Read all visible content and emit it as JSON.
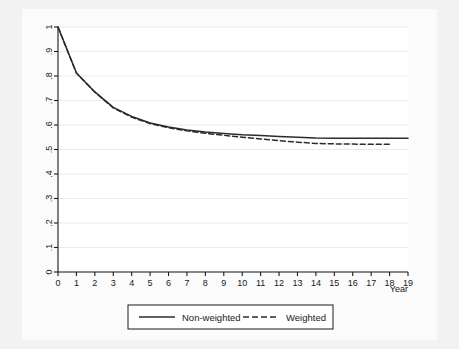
{
  "figure": {
    "background_color": "#f2f2f2",
    "plot_background_color": "#ffffff",
    "line_color": "#2b2b2b"
  },
  "chart_data": {
    "type": "line",
    "title": "",
    "subtitle": "",
    "xlabel": "Year",
    "ylabel": "",
    "xlim": [
      0,
      19
    ],
    "ylim": [
      0,
      1
    ],
    "grid": true,
    "grid_orientation": "horizontal",
    "legend_position": "below-center",
    "legend_boxed": true,
    "x": [
      0,
      1,
      2,
      3,
      4,
      5,
      6,
      7,
      8,
      9,
      10,
      11,
      12,
      13,
      14,
      15,
      16,
      17,
      18,
      19
    ],
    "xticklabels": [
      "0",
      "1",
      "2",
      "3",
      "4",
      "5",
      "6",
      "7",
      "8",
      "9",
      "10",
      "11",
      "12",
      "13",
      "14",
      "15",
      "16",
      "17",
      "18",
      "19"
    ],
    "yticks": [
      0,
      0.1,
      0.2,
      0.3,
      0.4,
      0.5,
      0.6,
      0.7,
      0.8,
      0.9,
      1
    ],
    "yticklabels": [
      "0",
      ".1",
      ".2",
      ".3",
      ".4",
      ".5",
      ".6",
      ".7",
      ".8",
      ".9",
      "1"
    ],
    "ytick_rotation": 90,
    "series": [
      {
        "name": "Non-weighted",
        "style": "solid",
        "color": "#2b2b2b",
        "values": [
          1.0,
          0.812,
          0.735,
          0.672,
          0.635,
          0.608,
          0.592,
          0.58,
          0.571,
          0.565,
          0.56,
          0.557,
          0.553,
          0.55,
          0.547,
          0.546,
          0.546,
          0.546,
          0.546,
          0.546
        ]
      },
      {
        "name": "Weighted",
        "style": "dashed",
        "color": "#2b2b2b",
        "values": [
          1.0,
          0.812,
          0.734,
          0.67,
          0.632,
          0.606,
          0.589,
          0.576,
          0.566,
          0.558,
          0.55,
          0.543,
          0.536,
          0.53,
          0.525,
          0.523,
          0.522,
          0.521,
          0.521,
          null
        ]
      }
    ]
  },
  "legend": {
    "entries": [
      {
        "label": "Non-weighted",
        "style": "solid"
      },
      {
        "label": "Weighted",
        "style": "dashed"
      }
    ]
  }
}
